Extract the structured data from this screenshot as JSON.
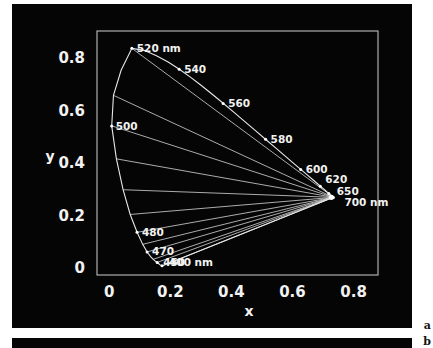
{
  "figure": {
    "panel_a_letter": "a",
    "panel_b_letter": "b"
  },
  "chart_data": {
    "type": "line",
    "title": "",
    "xlabel": "x",
    "ylabel": "y",
    "xlim": [
      -0.04,
      0.88
    ],
    "ylim": [
      -0.03,
      0.9
    ],
    "xticks": [
      "0",
      "0.2",
      "0.4",
      "0.6",
      "0.8"
    ],
    "xtick_values": [
      0,
      0.2,
      0.4,
      0.6,
      0.8
    ],
    "yticks": [
      "0",
      "0.2",
      "0.4",
      "0.6",
      "0.8"
    ],
    "ytick_values": [
      0,
      0.2,
      0.4,
      0.6,
      0.8
    ],
    "grid": false,
    "legend": "none",
    "annotations": [
      {
        "label": "520 nm",
        "wavelength": 520,
        "x": 0.074,
        "y": 0.834,
        "unit": "nm"
      },
      {
        "label": "540",
        "wavelength": 540,
        "x": 0.229,
        "y": 0.754,
        "unit": ""
      },
      {
        "label": "560",
        "wavelength": 560,
        "x": 0.373,
        "y": 0.624,
        "unit": ""
      },
      {
        "label": "580",
        "wavelength": 580,
        "x": 0.512,
        "y": 0.487,
        "unit": ""
      },
      {
        "label": "600",
        "wavelength": 600,
        "x": 0.627,
        "y": 0.372,
        "unit": ""
      },
      {
        "label": "620",
        "wavelength": 620,
        "x": 0.691,
        "y": 0.308,
        "unit": ""
      },
      {
        "label": "650",
        "wavelength": 650,
        "x": 0.719,
        "y": 0.281,
        "unit": ""
      },
      {
        "label": "700 nm",
        "wavelength": 700,
        "x": 0.734,
        "y": 0.265,
        "unit": "nm"
      },
      {
        "label": "500",
        "wavelength": 500,
        "x": 0.008,
        "y": 0.538,
        "unit": ""
      },
      {
        "label": "480",
        "wavelength": 480,
        "x": 0.091,
        "y": 0.133,
        "unit": ""
      },
      {
        "label": "470",
        "wavelength": 470,
        "x": 0.124,
        "y": 0.058,
        "unit": ""
      },
      {
        "label": "450",
        "wavelength": 450,
        "x": 0.157,
        "y": 0.018,
        "unit": ""
      },
      {
        "label": "400 nm",
        "wavelength": 400,
        "x": 0.173,
        "y": 0.005,
        "unit": "nm"
      }
    ],
    "spectral_locus": [
      [
        0.1741,
        0.005
      ],
      [
        0.174,
        0.005
      ],
      [
        0.1738,
        0.0049
      ],
      [
        0.1736,
        0.0049
      ],
      [
        0.1733,
        0.0048
      ],
      [
        0.173,
        0.0048
      ],
      [
        0.1726,
        0.0048
      ],
      [
        0.1721,
        0.0048
      ],
      [
        0.1714,
        0.0051
      ],
      [
        0.1703,
        0.0058
      ],
      [
        0.1689,
        0.0069
      ],
      [
        0.1669,
        0.0086
      ],
      [
        0.1644,
        0.0109
      ],
      [
        0.1611,
        0.0138
      ],
      [
        0.1566,
        0.0177
      ],
      [
        0.151,
        0.0227
      ],
      [
        0.144,
        0.0297
      ],
      [
        0.1355,
        0.0399
      ],
      [
        0.1241,
        0.0578
      ],
      [
        0.1096,
        0.0868
      ],
      [
        0.0913,
        0.1327
      ],
      [
        0.0687,
        0.2007
      ],
      [
        0.0454,
        0.295
      ],
      [
        0.0235,
        0.4127
      ],
      [
        0.0082,
        0.5384
      ],
      [
        0.0139,
        0.6548
      ],
      [
        0.0389,
        0.7502
      ],
      [
        0.0743,
        0.8338
      ],
      [
        0.1142,
        0.8262
      ],
      [
        0.1547,
        0.8059
      ],
      [
        0.1929,
        0.7816
      ],
      [
        0.2296,
        0.7543
      ],
      [
        0.2658,
        0.7243
      ],
      [
        0.3016,
        0.6923
      ],
      [
        0.3373,
        0.6589
      ],
      [
        0.3731,
        0.6245
      ],
      [
        0.4087,
        0.5896
      ],
      [
        0.4441,
        0.5547
      ],
      [
        0.4788,
        0.5202
      ],
      [
        0.5125,
        0.4866
      ],
      [
        0.5448,
        0.4544
      ],
      [
        0.5752,
        0.4242
      ],
      [
        0.6029,
        0.3965
      ],
      [
        0.627,
        0.3725
      ],
      [
        0.6482,
        0.3514
      ],
      [
        0.6658,
        0.334
      ],
      [
        0.6801,
        0.3197
      ],
      [
        0.6915,
        0.3083
      ],
      [
        0.7006,
        0.2993
      ],
      [
        0.7079,
        0.292
      ],
      [
        0.714,
        0.2859
      ],
      [
        0.719,
        0.2809
      ],
      [
        0.723,
        0.277
      ],
      [
        0.726,
        0.274
      ],
      [
        0.7283,
        0.2717
      ],
      [
        0.73,
        0.27
      ],
      [
        0.7311,
        0.2689
      ],
      [
        0.732,
        0.268
      ],
      [
        0.7327,
        0.2673
      ],
      [
        0.7334,
        0.2666
      ],
      [
        0.734,
        0.266
      ]
    ],
    "purple_line": [
      [
        0.734,
        0.266
      ],
      [
        0.1741,
        0.005
      ]
    ],
    "convergence_point": {
      "x": 0.734,
      "y": 0.266,
      "label": "700 nm"
    },
    "mixing_line_endpoints": [
      {
        "wavelength": 520,
        "x": 0.0743,
        "y": 0.8338
      },
      {
        "wavelength": 510,
        "x": 0.0139,
        "y": 0.6548
      },
      {
        "wavelength": 500,
        "x": 0.0082,
        "y": 0.5384
      },
      {
        "wavelength": 495,
        "x": 0.0235,
        "y": 0.4127
      },
      {
        "wavelength": 490,
        "x": 0.0454,
        "y": 0.295
      },
      {
        "wavelength": 485,
        "x": 0.0687,
        "y": 0.2007
      },
      {
        "wavelength": 480,
        "x": 0.0913,
        "y": 0.1327
      },
      {
        "wavelength": 475,
        "x": 0.1096,
        "y": 0.0868
      },
      {
        "wavelength": 470,
        "x": 0.1241,
        "y": 0.0578
      },
      {
        "wavelength": 460,
        "x": 0.144,
        "y": 0.0297
      },
      {
        "wavelength": 450,
        "x": 0.1566,
        "y": 0.0177
      },
      {
        "wavelength": 400,
        "x": 0.1741,
        "y": 0.005
      }
    ]
  }
}
